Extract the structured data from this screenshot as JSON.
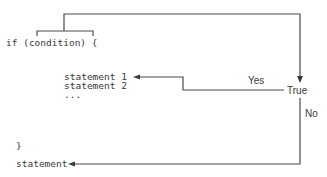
{
  "diagram": {
    "type": "flowchart",
    "title": "",
    "code": {
      "if_line": "if (condition) {",
      "statements": [
        "statement 1",
        "statement 2",
        "..."
      ],
      "close_brace": "}",
      "after_statement": "statement"
    },
    "labels": {
      "decision": "True",
      "yes": "Yes",
      "no": "No"
    },
    "colors": {
      "line": "#4a4a4a",
      "text": "#3a3a3a",
      "background": "#ffffff"
    }
  }
}
